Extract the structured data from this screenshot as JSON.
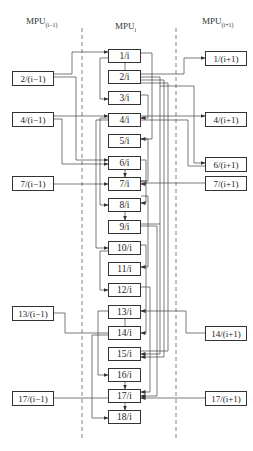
{
  "headers": {
    "left": {
      "base": "MPU",
      "sub": "(i−1)"
    },
    "middle": {
      "base": "MPU",
      "sub": "i"
    },
    "right": {
      "base": "MPU",
      "sub": "(i+1)"
    }
  },
  "middle_units": [
    {
      "label": "1/i",
      "y": 49
    },
    {
      "label": "2/i",
      "y": 70
    },
    {
      "label": "3/i",
      "y": 91
    },
    {
      "label": "4/i",
      "y": 113
    },
    {
      "label": "5/i",
      "y": 134
    },
    {
      "label": "6/i",
      "y": 156
    },
    {
      "label": "7/i",
      "y": 177
    },
    {
      "label": "8/i",
      "y": 198
    },
    {
      "label": "9/i",
      "y": 220
    },
    {
      "label": "10/i",
      "y": 241
    },
    {
      "label": "11/i",
      "y": 262
    },
    {
      "label": "12/i",
      "y": 283
    },
    {
      "label": "13/i",
      "y": 305
    },
    {
      "label": "14/i",
      "y": 326
    },
    {
      "label": "15/i",
      "y": 347
    },
    {
      "label": "16/i",
      "y": 368
    },
    {
      "label": "17/i",
      "y": 389
    },
    {
      "label": "18/i",
      "y": 410
    }
  ],
  "left_units": [
    {
      "label": "2/(i−1)",
      "y": 71
    },
    {
      "label": "4/(i−1)",
      "y": 112
    },
    {
      "label": "7/(i−1)",
      "y": 176
    },
    {
      "label": "13/(i−1)",
      "y": 306
    },
    {
      "label": "17/(i−1)",
      "y": 391
    }
  ],
  "right_units": [
    {
      "label": "1/(i+1)",
      "y": 51
    },
    {
      "label": "4/(i+1)",
      "y": 112
    },
    {
      "label": "6/(i+1)",
      "y": 157
    },
    {
      "label": "7/(i+1)",
      "y": 176
    },
    {
      "label": "14/(i+1)",
      "y": 326
    },
    {
      "label": "17/(i+1)",
      "y": 391
    }
  ]
}
